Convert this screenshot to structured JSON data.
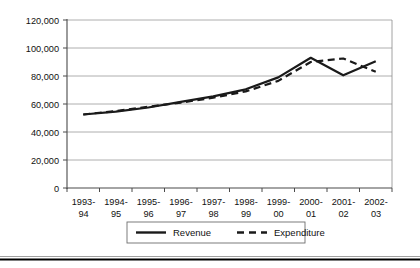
{
  "chart_data": {
    "type": "line",
    "title": "",
    "subtitle": "",
    "xlabel": "",
    "ylabel": "",
    "ylim": [
      0,
      120000
    ],
    "xlim_categories": 10,
    "grid": true,
    "legend_position": "bottom-center",
    "categories": [
      "1993-94",
      "1994-95",
      "1995-96",
      "1996-97",
      "1997-98",
      "1998-99",
      "1999-00",
      "2000-01",
      "2001-02",
      "2002-03"
    ],
    "category_lines": [
      [
        "1993-",
        "94"
      ],
      [
        "1994-",
        "95"
      ],
      [
        "1995-",
        "96"
      ],
      [
        "1996-",
        "97"
      ],
      [
        "1997-",
        "98"
      ],
      [
        "1998-",
        "99"
      ],
      [
        "1999-",
        "00"
      ],
      [
        "2000-",
        "01"
      ],
      [
        "2001-",
        "02"
      ],
      [
        "2002-",
        "03"
      ]
    ],
    "ytick_labels": [
      "120,000",
      "100,000",
      "80,000",
      "60,000",
      "40,000",
      "20,000",
      "0"
    ],
    "ytick_values": [
      120000,
      100000,
      80000,
      60000,
      40000,
      20000,
      0
    ],
    "series": [
      {
        "name": "Revenue",
        "style": "solid",
        "color": "#1a1a1a",
        "values": [
          52500,
          54500,
          57500,
          61500,
          65500,
          70500,
          79000,
          93000,
          80500,
          90500
        ]
      },
      {
        "name": "Expenditure",
        "style": "dashed",
        "color": "#1a1a1a",
        "values": [
          52500,
          55000,
          58000,
          61000,
          64500,
          69000,
          76500,
          90000,
          92500,
          83000
        ]
      }
    ]
  },
  "legend": {
    "items": [
      {
        "label": "Revenue",
        "style": "solid"
      },
      {
        "label": "Expenditure",
        "style": "dashed"
      }
    ]
  },
  "colors": {
    "line": "#1a1a1a",
    "grid": "#9a9a9a",
    "axis": "#4a4a4a",
    "background": "#ffffff"
  }
}
